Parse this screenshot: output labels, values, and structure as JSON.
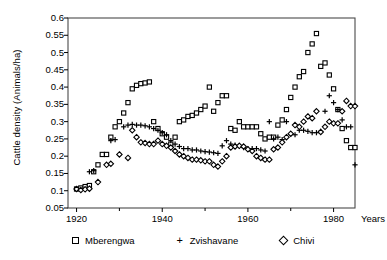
{
  "chart_data": {
    "type": "scatter",
    "title": "",
    "xlabel": "Years",
    "ylabel": "Cattle density (Animals/ha)",
    "xlim": [
      1918,
      1985
    ],
    "ylim": [
      0.05,
      0.6
    ],
    "grid": false,
    "legend_position": "bottom",
    "x_ticks": [
      1920,
      1940,
      1960,
      1980
    ],
    "y_ticks": [
      0.05,
      0.1,
      0.15,
      0.2,
      0.25,
      0.3,
      0.35,
      0.4,
      0.45,
      0.5,
      0.55,
      0.6
    ],
    "x_tick_labels": [
      "1920",
      "1940",
      "1960",
      "1980"
    ],
    "y_tick_labels": [
      "0.05",
      "0.1",
      "0.15",
      "0.2",
      "0.25",
      "0.3",
      "0.35",
      "0.4",
      "0.45",
      "0.5",
      "0.55",
      "0.6"
    ],
    "series": [
      {
        "name": "Mberengwa",
        "marker": "square",
        "color": "#000000",
        "points": [
          [
            1920,
            0.105
          ],
          [
            1921,
            0.108
          ],
          [
            1922,
            0.112
          ],
          [
            1923,
            0.115
          ],
          [
            1924,
            0.155
          ],
          [
            1925,
            0.175
          ],
          [
            1926,
            0.205
          ],
          [
            1927,
            0.205
          ],
          [
            1928,
            0.255
          ],
          [
            1929,
            0.285
          ],
          [
            1930,
            0.3
          ],
          [
            1931,
            0.325
          ],
          [
            1932,
            0.355
          ],
          [
            1933,
            0.395
          ],
          [
            1934,
            0.405
          ],
          [
            1935,
            0.41
          ],
          [
            1936,
            0.412
          ],
          [
            1937,
            0.415
          ],
          [
            1938,
            0.3
          ],
          [
            1939,
            0.28
          ],
          [
            1940,
            0.265
          ],
          [
            1941,
            0.255
          ],
          [
            1942,
            0.235
          ],
          [
            1943,
            0.255
          ],
          [
            1944,
            0.3
          ],
          [
            1945,
            0.305
          ],
          [
            1946,
            0.315
          ],
          [
            1947,
            0.318
          ],
          [
            1948,
            0.325
          ],
          [
            1949,
            0.335
          ],
          [
            1950,
            0.345
          ],
          [
            1951,
            0.4
          ],
          [
            1952,
            0.33
          ],
          [
            1953,
            0.355
          ],
          [
            1954,
            0.375
          ],
          [
            1955,
            0.375
          ],
          [
            1956,
            0.28
          ],
          [
            1957,
            0.275
          ],
          [
            1958,
            0.3
          ],
          [
            1959,
            0.285
          ],
          [
            1960,
            0.285
          ],
          [
            1961,
            0.285
          ],
          [
            1962,
            0.285
          ],
          [
            1963,
            0.265
          ],
          [
            1964,
            0.25
          ],
          [
            1965,
            0.255
          ],
          [
            1966,
            0.255
          ],
          [
            1967,
            0.29
          ],
          [
            1968,
            0.305
          ],
          [
            1969,
            0.335
          ],
          [
            1970,
            0.37
          ],
          [
            1971,
            0.4
          ],
          [
            1972,
            0.43
          ],
          [
            1973,
            0.445
          ],
          [
            1974,
            0.5
          ],
          [
            1975,
            0.525
          ],
          [
            1976,
            0.555
          ],
          [
            1977,
            0.46
          ],
          [
            1978,
            0.47
          ],
          [
            1979,
            0.435
          ],
          [
            1980,
            0.395
          ],
          [
            1981,
            0.335
          ],
          [
            1982,
            0.28
          ],
          [
            1983,
            0.245
          ],
          [
            1984,
            0.225
          ],
          [
            1985,
            0.225
          ]
        ]
      },
      {
        "name": "Zvishavane",
        "marker": "plus",
        "color": "#000000",
        "points": [
          [
            1923,
            0.155
          ],
          [
            1924,
            0.158
          ],
          [
            1928,
            0.245
          ],
          [
            1929,
            0.248
          ],
          [
            1931,
            0.285
          ],
          [
            1932,
            0.29
          ],
          [
            1933,
            0.292
          ],
          [
            1934,
            0.29
          ],
          [
            1935,
            0.29
          ],
          [
            1936,
            0.288
          ],
          [
            1937,
            0.285
          ],
          [
            1938,
            0.28
          ],
          [
            1939,
            0.275
          ],
          [
            1940,
            0.268
          ],
          [
            1941,
            0.262
          ],
          [
            1942,
            0.245
          ],
          [
            1943,
            0.235
          ],
          [
            1944,
            0.228
          ],
          [
            1945,
            0.222
          ],
          [
            1946,
            0.222
          ],
          [
            1947,
            0.218
          ],
          [
            1948,
            0.218
          ],
          [
            1949,
            0.215
          ],
          [
            1950,
            0.213
          ],
          [
            1951,
            0.212
          ],
          [
            1952,
            0.21
          ],
          [
            1953,
            0.208
          ],
          [
            1954,
            0.23
          ],
          [
            1955,
            0.245
          ],
          [
            1956,
            0.235
          ],
          [
            1957,
            0.232
          ],
          [
            1958,
            0.228
          ],
          [
            1959,
            0.225
          ],
          [
            1960,
            0.222
          ],
          [
            1961,
            0.222
          ],
          [
            1962,
            0.222
          ],
          [
            1963,
            0.218
          ],
          [
            1964,
            0.215
          ],
          [
            1965,
            0.3
          ],
          [
            1966,
            0.25
          ],
          [
            1967,
            0.255
          ],
          [
            1968,
            0.248
          ],
          [
            1969,
            0.3
          ],
          [
            1970,
            0.265
          ],
          [
            1971,
            0.262
          ],
          [
            1972,
            0.275
          ],
          [
            1973,
            0.275
          ],
          [
            1974,
            0.272
          ],
          [
            1975,
            0.268
          ],
          [
            1976,
            0.268
          ],
          [
            1977,
            0.272
          ],
          [
            1978,
            0.33
          ],
          [
            1979,
            0.375
          ],
          [
            1980,
            0.355
          ],
          [
            1981,
            0.335
          ],
          [
            1982,
            0.305
          ],
          [
            1983,
            0.285
          ],
          [
            1984,
            0.285
          ],
          [
            1985,
            0.175
          ]
        ]
      },
      {
        "name": "Chivi",
        "marker": "diamond",
        "color": "#000000",
        "points": [
          [
            1920,
            0.105
          ],
          [
            1921,
            0.102
          ],
          [
            1922,
            0.104
          ],
          [
            1923,
            0.106
          ],
          [
            1925,
            0.125
          ],
          [
            1927,
            0.175
          ],
          [
            1928,
            0.178
          ],
          [
            1930,
            0.205
          ],
          [
            1932,
            0.195
          ],
          [
            1933,
            0.275
          ],
          [
            1934,
            0.255
          ],
          [
            1935,
            0.24
          ],
          [
            1936,
            0.238
          ],
          [
            1937,
            0.235
          ],
          [
            1938,
            0.235
          ],
          [
            1939,
            0.245
          ],
          [
            1940,
            0.235
          ],
          [
            1941,
            0.23
          ],
          [
            1942,
            0.225
          ],
          [
            1943,
            0.215
          ],
          [
            1944,
            0.205
          ],
          [
            1945,
            0.2
          ],
          [
            1946,
            0.195
          ],
          [
            1947,
            0.19
          ],
          [
            1948,
            0.19
          ],
          [
            1949,
            0.188
          ],
          [
            1950,
            0.185
          ],
          [
            1951,
            0.185
          ],
          [
            1952,
            0.175
          ],
          [
            1953,
            0.17
          ],
          [
            1954,
            0.185
          ],
          [
            1955,
            0.2
          ],
          [
            1956,
            0.225
          ],
          [
            1957,
            0.228
          ],
          [
            1958,
            0.23
          ],
          [
            1959,
            0.228
          ],
          [
            1960,
            0.22
          ],
          [
            1961,
            0.215
          ],
          [
            1962,
            0.2
          ],
          [
            1963,
            0.195
          ],
          [
            1964,
            0.19
          ],
          [
            1965,
            0.19
          ],
          [
            1966,
            0.22
          ],
          [
            1967,
            0.225
          ],
          [
            1968,
            0.24
          ],
          [
            1969,
            0.255
          ],
          [
            1970,
            0.265
          ],
          [
            1971,
            0.29
          ],
          [
            1972,
            0.285
          ],
          [
            1973,
            0.3
          ],
          [
            1974,
            0.315
          ],
          [
            1975,
            0.31
          ],
          [
            1976,
            0.33
          ],
          [
            1977,
            0.27
          ],
          [
            1978,
            0.285
          ],
          [
            1979,
            0.3
          ],
          [
            1980,
            0.295
          ],
          [
            1981,
            0.295
          ],
          [
            1982,
            0.33
          ],
          [
            1983,
            0.36
          ],
          [
            1984,
            0.345
          ],
          [
            1985,
            0.345
          ]
        ]
      }
    ]
  },
  "legend": {
    "items": [
      {
        "label": "Mberengwa",
        "marker": "square"
      },
      {
        "label": "Zvishavane",
        "marker": "plus"
      },
      {
        "label": "Chivi",
        "marker": "diamond"
      }
    ]
  }
}
